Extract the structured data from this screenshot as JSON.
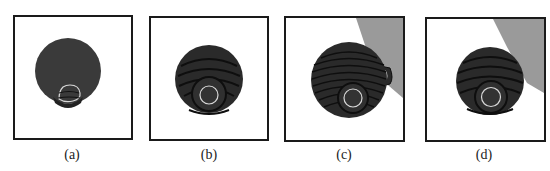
{
  "figure": {
    "panels": [
      {
        "id": "a",
        "caption": "(a)",
        "description": "single dark gray disk with small light contour near bottom",
        "background_region": false
      },
      {
        "id": "b",
        "caption": "(b)",
        "description": "dark disk with concentric arc bands and light inner contour",
        "background_region": false
      },
      {
        "id": "c",
        "caption": "(c)",
        "description": "dark disk with many concentric bands, gray region upper right, small attached blob",
        "background_region": true
      },
      {
        "id": "d",
        "caption": "(d)",
        "description": "dark disk with concentric bands and light inner contour, gray region upper right",
        "background_region": true
      }
    ],
    "colors": {
      "frame": "#1a1a1a",
      "disk_fill": "#3a3a3a",
      "disk_dark": "#222222",
      "band_line": "#0e0e0e",
      "contour": "#d8d8d8",
      "gray_region": "#9a9a9a",
      "background": "#ffffff"
    }
  }
}
